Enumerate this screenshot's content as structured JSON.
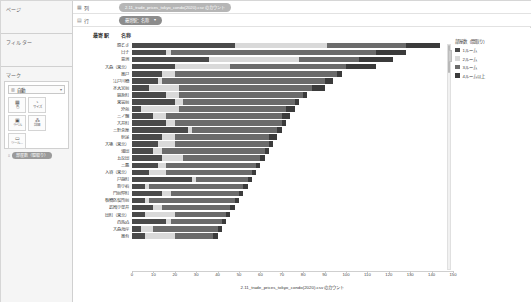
{
  "app": {
    "title": "Tableau Worksheet"
  },
  "sidebar": {
    "pages_label": "ページ",
    "filters_label": "フィルター",
    "marks_label": "マーク",
    "marks_type": {
      "icon": "bar-mark-icon",
      "label": "自動",
      "caret": "▾"
    },
    "mark_buttons": [
      {
        "name": "color",
        "glyph": "▦",
        "label": "色"
      },
      {
        "name": "size",
        "glyph": "◔",
        "label": "サイズ"
      },
      {
        "name": "label",
        "glyph": "▣",
        "label": "ラベル"
      },
      {
        "name": "detail",
        "glyph": "⁂",
        "label": "詳細"
      },
      {
        "name": "tooltip",
        "glyph": "▭",
        "label": "ツール..."
      }
    ],
    "detail_pill": {
      "icon": "abc-icon",
      "label": "部屋数（間取り）"
    }
  },
  "shelves": {
    "columns_label": "列",
    "columns_icon": "columns-icon",
    "rows_label": "行",
    "rows_icon": "rows-icon",
    "columns_pill": "2.11_trade_prices_tokyo_condo(2020).csv のカウント",
    "rows_pill": "最寄駅：名称",
    "rows_pill_caret": "▾"
  },
  "viz": {
    "header_left": "最寄駅",
    "header_right": "名称",
    "axis_title": "2.11_trade_prices_tokyo_condo(2020).csv のカウント"
  },
  "legend": {
    "title": "部屋数（間取り）",
    "items": [
      {
        "label": "1ルーム",
        "color": "#4a4a4a"
      },
      {
        "label": "2ルーム",
        "color": "#d9d9d9"
      },
      {
        "label": "3ルーム",
        "color": "#6b6b6b"
      },
      {
        "label": "4ルーム以上",
        "color": "#3b3b3b"
      }
    ]
  },
  "chart_data": {
    "type": "bar",
    "orientation": "horizontal",
    "stacked": true,
    "title": "",
    "xlabel": "2.11_trade_prices_tokyo_condo(2020).csv のカウント",
    "ylabel": "最寄駅 名称",
    "xlim": [
      0,
      150
    ],
    "xticks": [
      0,
      10,
      20,
      30,
      40,
      50,
      60,
      70,
      80,
      90,
      100,
      110,
      120,
      130,
      140,
      150
    ],
    "grid": false,
    "legend_position": "right",
    "series": [
      {
        "name": "1ルーム",
        "color": "#4a4a4a"
      },
      {
        "name": "2ルーム",
        "color": "#d9d9d9"
      },
      {
        "name": "3ルーム",
        "color": "#6b6b6b"
      },
      {
        "name": "4ルーム以上",
        "color": "#3b3b3b"
      }
    ],
    "categories": [
      "勝どき",
      "白子",
      "豊洲",
      "大森（東京）",
      "亀戸",
      "江戸川橋",
      "水天宮前",
      "錦糸町",
      "東雲前",
      "外苑",
      "三ノ輪",
      "大井町",
      "三軒茶屋",
      "荻窪",
      "大塚（東京）",
      "蒲田",
      "五反田",
      "三鷹",
      "入谷（東京）",
      "戸越町",
      "新小岩",
      "門前仲町",
      "板橋区役所前",
      "武蔵小金井",
      "田町（東京）",
      "西馬込",
      "大森海岸",
      "亀有"
    ],
    "rows": [
      {
        "station": "勝どき",
        "values": [
          48,
          43,
          37,
          16
        ],
        "total": 144
      },
      {
        "station": "白子",
        "values": [
          16,
          2,
          96,
          14
        ],
        "total": 128
      },
      {
        "station": "豊洲",
        "values": [
          36,
          42,
          28,
          16
        ],
        "total": 122
      },
      {
        "station": "大森（東京）",
        "values": [
          20,
          26,
          54,
          14
        ],
        "total": 114
      },
      {
        "station": "亀戸",
        "values": [
          14,
          6,
          76,
          2
        ],
        "total": 98
      },
      {
        "station": "江戸川橋",
        "values": [
          12,
          2,
          76,
          4
        ],
        "total": 94
      },
      {
        "station": "水天宮前",
        "values": [
          8,
          14,
          62,
          6
        ],
        "total": 90
      },
      {
        "station": "錦糸町",
        "values": [
          16,
          6,
          58,
          2
        ],
        "total": 82
      },
      {
        "station": "東雲前",
        "values": [
          20,
          4,
          52,
          2
        ],
        "total": 78
      },
      {
        "station": "外苑",
        "values": [
          4,
          18,
          50,
          4
        ],
        "total": 76
      },
      {
        "station": "三ノ輪",
        "values": [
          10,
          6,
          54,
          4
        ],
        "total": 74
      },
      {
        "station": "大井町",
        "values": [
          16,
          4,
          50,
          2
        ],
        "total": 72
      },
      {
        "station": "三軒茶屋",
        "values": [
          26,
          2,
          40,
          2
        ],
        "total": 70
      },
      {
        "station": "荻窪",
        "values": [
          14,
          6,
          44,
          4
        ],
        "total": 68
      },
      {
        "station": "大塚（東京）",
        "values": [
          12,
          8,
          44,
          2
        ],
        "total": 66
      },
      {
        "station": "蒲田",
        "values": [
          10,
          4,
          48,
          2
        ],
        "total": 64
      },
      {
        "station": "五反田",
        "values": [
          14,
          10,
          36,
          2
        ],
        "total": 62
      },
      {
        "station": "三鷹",
        "values": [
          12,
          4,
          42,
          2
        ],
        "total": 60
      },
      {
        "station": "入谷（東京）",
        "values": [
          8,
          8,
          40,
          2
        ],
        "total": 58
      },
      {
        "station": "戸越町",
        "values": [
          28,
          2,
          24,
          2
        ],
        "total": 56
      },
      {
        "station": "新小岩",
        "values": [
          6,
          2,
          44,
          2
        ],
        "total": 54
      },
      {
        "station": "門前仲町",
        "values": [
          14,
          4,
          32,
          2
        ],
        "total": 52
      },
      {
        "station": "板橋区役所前",
        "values": [
          6,
          2,
          40,
          2
        ],
        "total": 50
      },
      {
        "station": "武蔵小金井",
        "values": [
          10,
          4,
          32,
          2
        ],
        "total": 48
      },
      {
        "station": "田町（東京）",
        "values": [
          6,
          14,
          24,
          2
        ],
        "total": 46
      },
      {
        "station": "西馬込",
        "values": [
          16,
          2,
          24,
          2
        ],
        "total": 44
      },
      {
        "station": "大森海岸",
        "values": [
          4,
          6,
          30,
          2
        ],
        "total": 42
      },
      {
        "station": "亀有",
        "values": [
          6,
          14,
          18,
          2
        ],
        "total": 40
      }
    ]
  }
}
